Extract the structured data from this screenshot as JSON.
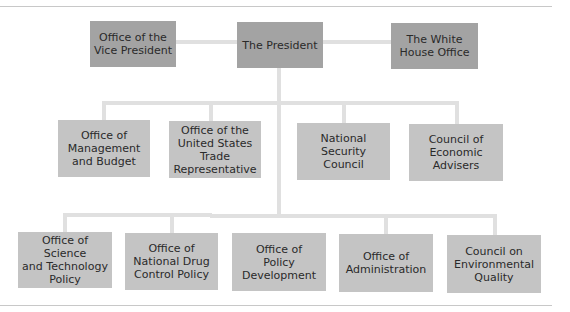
{
  "diagram": {
    "top_row": [
      {
        "id": "vp",
        "label": "Office of the\nVice President"
      },
      {
        "id": "president",
        "label": "The President"
      },
      {
        "id": "whitehouse",
        "label": "The White\nHouse Office"
      }
    ],
    "middle_row": [
      {
        "id": "omb",
        "label": "Office of\nManagement\nand Budget"
      },
      {
        "id": "ustr",
        "label": "Office of the\nUnited States\nTrade\nRepresentative"
      },
      {
        "id": "nsc",
        "label": "National\nSecurity\nCouncil"
      },
      {
        "id": "cea",
        "label": "Council of\nEconomic\nAdvisers"
      }
    ],
    "bottom_row": [
      {
        "id": "ostp",
        "label": "Office of Science\nand Technology\nPolicy"
      },
      {
        "id": "ondcp",
        "label": "Office of\nNational Drug\nControl Policy"
      },
      {
        "id": "opd",
        "label": "Office of\nPolicy\nDevelopment"
      },
      {
        "id": "oa",
        "label": "Office of\nAdministration"
      },
      {
        "id": "ceq",
        "label": "Council on\nEnvironmental\nQuality"
      }
    ],
    "colors": {
      "top_box": "#a3a3a3",
      "lower_box": "#c4c4c4",
      "connector": "#e0e0e0",
      "text": "#2a2a2a"
    }
  }
}
